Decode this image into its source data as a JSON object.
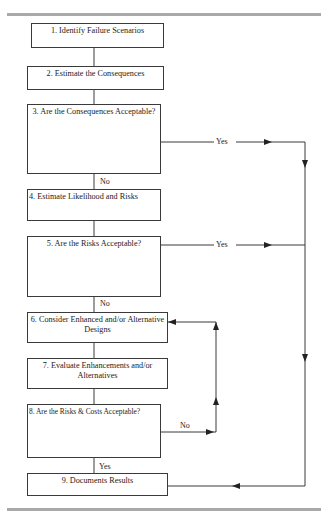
{
  "flowchart": {
    "steps": [
      {
        "id": 1,
        "label": "1. Identify Failure Scenarios"
      },
      {
        "id": 2,
        "label": "2. Estimate the Consequences"
      },
      {
        "id": 3,
        "label": "3. Are the Consequences Acceptable?"
      },
      {
        "id": 4,
        "label": "4. Estimate Likelihood and Risks"
      },
      {
        "id": 5,
        "label": "5. Are the Risks Acceptable?"
      },
      {
        "id": 6,
        "label": "6. Consider Enhanced and/or Alternative Designs"
      },
      {
        "id": 7,
        "label": "7. Evaluate Enhancements and/or Alternatives"
      },
      {
        "id": 8,
        "label": "8. Are the Risks & Costs Acceptable?"
      },
      {
        "id": 9,
        "label": "9. Documents Results"
      }
    ],
    "edge_labels": {
      "step3_yes": "Yes",
      "step3_no": "No",
      "step5_yes": "Yes",
      "step5_no": "No",
      "step8_no": "No",
      "step8_yes": "Yes"
    },
    "colors": {
      "line": "#3a3a3a",
      "rule": "#a9a9a9",
      "background": "#ffffff"
    }
  }
}
